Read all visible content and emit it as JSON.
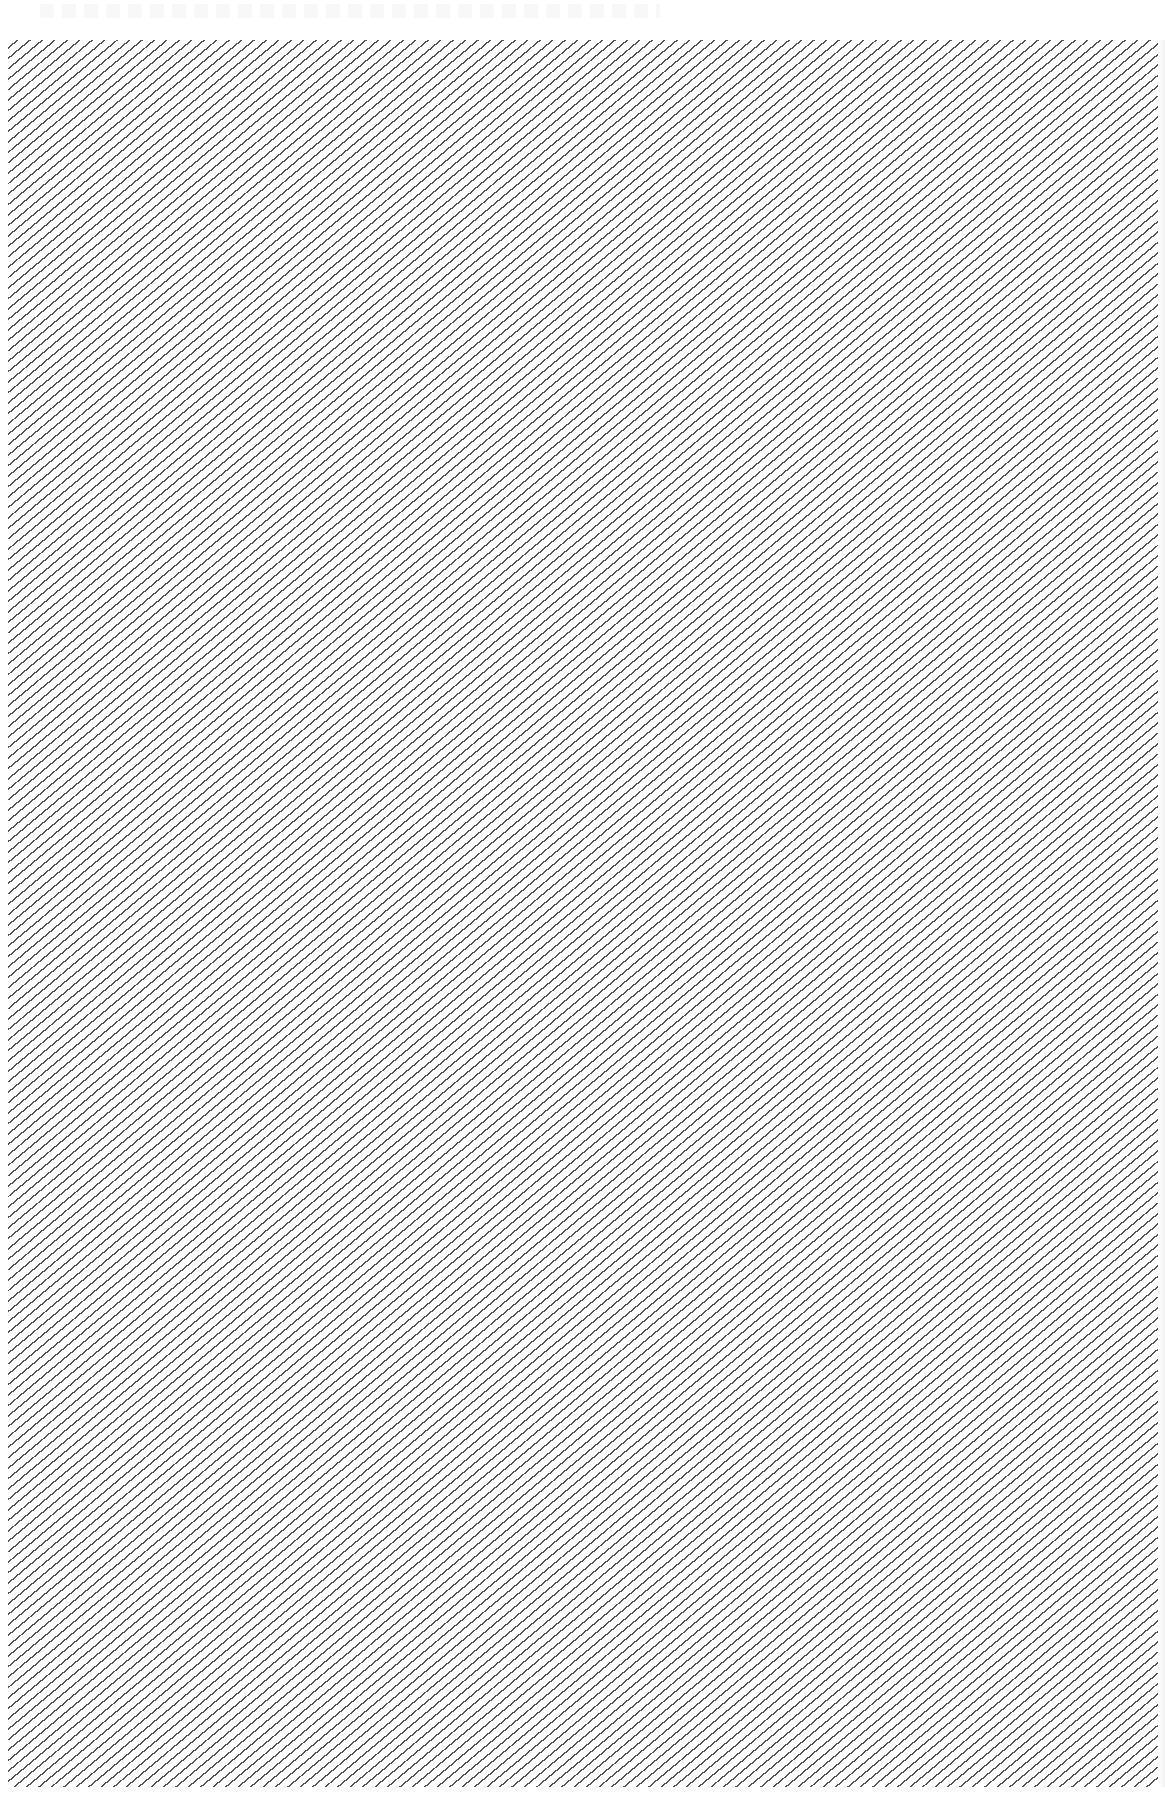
{
  "page": {
    "width": 1165,
    "height": 1814,
    "background": "#ffffff"
  },
  "header_strip": {
    "text": "",
    "legible": false
  },
  "hatch_panel": {
    "pattern": "diagonal-lines",
    "line_color": "#555555",
    "background": "#ffffff",
    "angle_deg": 40,
    "line_spacing_px": 8,
    "bounds": {
      "x": 8,
      "y": 40,
      "width": 1150,
      "height": 1747
    }
  }
}
